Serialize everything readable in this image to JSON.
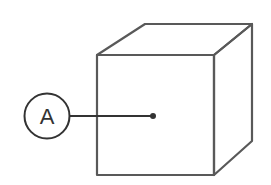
{
  "diagram": {
    "type": "cube-with-callout",
    "callout": {
      "label": "A",
      "target": "front-face-center"
    },
    "colors": {
      "stroke": "#555555",
      "background": "#ffffff",
      "label": "#333333"
    }
  }
}
